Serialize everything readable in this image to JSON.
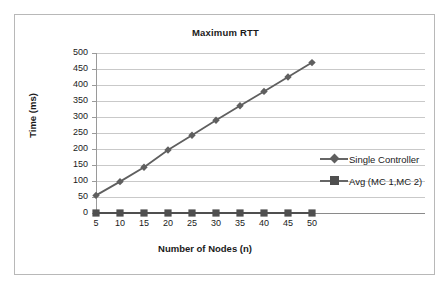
{
  "chart_data": {
    "type": "line",
    "title": "Maximum RTT",
    "xlabel": "Number of Nodes (n)",
    "ylabel": "Time  (ms)",
    "categories": [
      "5",
      "10",
      "15",
      "20",
      "25",
      "30",
      "35",
      "40",
      "45",
      "50"
    ],
    "x": [
      5,
      10,
      15,
      20,
      25,
      30,
      35,
      40,
      45,
      50
    ],
    "series": [
      {
        "name": "Single Controller",
        "marker": "diamond",
        "color": "#5f5f5f",
        "values": [
          55,
          98,
          143,
          197,
          243,
          290,
          335,
          380,
          425,
          470
        ]
      },
      {
        "name": "Avg (MC 1,MC 2)",
        "marker": "square",
        "color": "#4f4f4f",
        "values": [
          0,
          0,
          0,
          0,
          0,
          0,
          0,
          0,
          0,
          0
        ]
      }
    ],
    "ylim": [
      0,
      500
    ],
    "ytick_values": [
      0,
      50,
      100,
      150,
      200,
      250,
      300,
      350,
      400,
      450,
      500
    ],
    "ytick_labels": [
      "0",
      "50",
      "100",
      "150",
      "200",
      "250",
      "300",
      "350",
      "400",
      "450",
      "500"
    ],
    "xlim": [
      5,
      50
    ],
    "grid": true,
    "grid_axis": "y",
    "legend_position": "right"
  },
  "legend": {
    "entries": [
      {
        "label": "Single Controller"
      },
      {
        "label": "Avg (MC 1,MC 2)"
      }
    ]
  },
  "colors": {
    "grid": "#c9c9c9",
    "axis": "#9a9a9a",
    "series_1": "#5f5f5f",
    "series_2": "#4f4f4f",
    "text": "#1a1a1a",
    "frame": "#b8b8b8",
    "background": "#ffffff"
  }
}
